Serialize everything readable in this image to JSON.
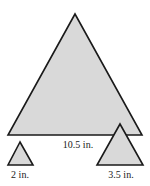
{
  "figure": {
    "fill_color": "#d9d9d9",
    "stroke_color": "#1a1a1a",
    "triangles": [
      {
        "id": "large",
        "points": "75,14 8,135 142,135",
        "label": "10.5 in.",
        "label_x": 78,
        "label_y": 140
      },
      {
        "id": "small",
        "points": "20,142 8,165 33,165",
        "label": "2 in.",
        "label_x": 20,
        "label_y": 170
      },
      {
        "id": "medium",
        "points": "120,124 97,165 143,165",
        "label": "3.5 in.",
        "label_x": 121,
        "label_y": 170
      }
    ]
  }
}
